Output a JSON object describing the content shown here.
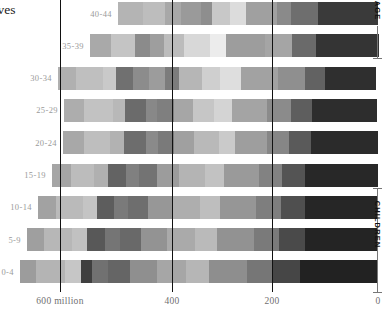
{
  "intro_text": {
    "lines": [
      "emselves",
      "n may",
      "mid."
    ]
  },
  "axis": {
    "ticks": [
      {
        "label": "600 million",
        "value": 600,
        "x": 60
      },
      {
        "label": "400",
        "value": 400,
        "x": 172
      },
      {
        "label": "200",
        "value": 200,
        "x": 272
      },
      {
        "label": "0",
        "value": 0,
        "x": 378
      }
    ]
  },
  "side_annotations": [
    {
      "label": "AGE",
      "name": "age-bracket"
    },
    {
      "label": "CHILDREN",
      "name": "children-bracket"
    }
  ],
  "chart_data": {
    "type": "bar",
    "title": "",
    "subtitle": "",
    "xlabel": "",
    "ylabel": "",
    "orientation": "horizontal",
    "stacked": true,
    "grid": true,
    "legend": false,
    "xlim": [
      0,
      660
    ],
    "x_direction": "right-to-left",
    "axis_ticks": [
      600,
      400,
      200,
      0
    ],
    "axis_tick_labels": [
      "600 million",
      "400",
      "200",
      "0"
    ],
    "categories": [
      "40-44",
      "35-39",
      "30-34",
      "25-29",
      "20-24",
      "15-19",
      "10-14",
      "5-9",
      "0-4"
    ],
    "note": "Horizontal stacked bars; each bar total is world population in that 5-year age band, split into region segments shown in greyscale shades.",
    "rows": [
      {
        "category": "40-44",
        "total": 490,
        "start_x": 118,
        "segments": [
          {
            "value": 48,
            "color": "#b4b4b4"
          },
          {
            "value": 40,
            "color": "#bdbdbd"
          },
          {
            "value": 30,
            "color": "#a8a8a8"
          },
          {
            "value": 38,
            "color": "#9a9a9a"
          },
          {
            "value": 22,
            "color": "#8e8e8e"
          },
          {
            "value": 34,
            "color": "#c8c8c8"
          },
          {
            "value": 30,
            "color": "#dcdcdc"
          },
          {
            "value": 58,
            "color": "#a0a0a0"
          },
          {
            "value": 26,
            "color": "#8a8a8a"
          },
          {
            "value": 52,
            "color": "#6e6e6e"
          },
          {
            "value": 112,
            "color": "#3a3a3a"
          }
        ]
      },
      {
        "category": "35-39",
        "total": 545,
        "start_x": 90,
        "segments": [
          {
            "value": 40,
            "color": "#a9a9a9"
          },
          {
            "value": 44,
            "color": "#c4c4c4"
          },
          {
            "value": 30,
            "color": "#8b8b8b"
          },
          {
            "value": 26,
            "color": "#9e9e9e"
          },
          {
            "value": 38,
            "color": "#bcbcbc"
          },
          {
            "value": 48,
            "color": "#d8d8d8"
          },
          {
            "value": 30,
            "color": "#ececec"
          },
          {
            "value": 74,
            "color": "#9d9d9d"
          },
          {
            "value": 52,
            "color": "#a5a5a5"
          },
          {
            "value": 44,
            "color": "#6a6a6a"
          },
          {
            "value": 119,
            "color": "#343434"
          }
        ]
      },
      {
        "category": "30-34",
        "total": 600,
        "start_x": 58,
        "segments": [
          {
            "value": 34,
            "color": "#b0b0b0"
          },
          {
            "value": 50,
            "color": "#bfbfbf"
          },
          {
            "value": 26,
            "color": "#c9c9c9"
          },
          {
            "value": 32,
            "color": "#707070"
          },
          {
            "value": 30,
            "color": "#8c8c8c"
          },
          {
            "value": 30,
            "color": "#9c9c9c"
          },
          {
            "value": 26,
            "color": "#7c7c7c"
          },
          {
            "value": 44,
            "color": "#b6b6b6"
          },
          {
            "value": 34,
            "color": "#cfcfcf"
          },
          {
            "value": 40,
            "color": "#dedede"
          },
          {
            "value": 70,
            "color": "#a2a2a2"
          },
          {
            "value": 50,
            "color": "#8f8f8f"
          },
          {
            "value": 38,
            "color": "#626262"
          },
          {
            "value": 96,
            "color": "#2f2f2f"
          }
        ]
      },
      {
        "category": "25-29",
        "total": 590,
        "start_x": 64,
        "segments": [
          {
            "value": 38,
            "color": "#adadad"
          },
          {
            "value": 54,
            "color": "#c2c2c2"
          },
          {
            "value": 24,
            "color": "#b8b8b8"
          },
          {
            "value": 38,
            "color": "#6b6b6b"
          },
          {
            "value": 22,
            "color": "#888888"
          },
          {
            "value": 32,
            "color": "#7f7f7f"
          },
          {
            "value": 36,
            "color": "#a6a6a6"
          },
          {
            "value": 40,
            "color": "#c6c6c6"
          },
          {
            "value": 34,
            "color": "#d4d4d4"
          },
          {
            "value": 66,
            "color": "#a4a4a4"
          },
          {
            "value": 44,
            "color": "#8b8b8b"
          },
          {
            "value": 40,
            "color": "#5e5e5e"
          },
          {
            "value": 122,
            "color": "#2d2d2d"
          }
        ]
      },
      {
        "category": "20-24",
        "total": 595,
        "start_x": 63,
        "segments": [
          {
            "value": 40,
            "color": "#a8a8a8"
          },
          {
            "value": 48,
            "color": "#bebebe"
          },
          {
            "value": 28,
            "color": "#b2b2b2"
          },
          {
            "value": 40,
            "color": "#6d6d6d"
          },
          {
            "value": 24,
            "color": "#8a8a8a"
          },
          {
            "value": 30,
            "color": "#7a7a7a"
          },
          {
            "value": 38,
            "color": "#a0a0a0"
          },
          {
            "value": 46,
            "color": "#b9b9b9"
          },
          {
            "value": 30,
            "color": "#cacaca"
          },
          {
            "value": 62,
            "color": "#9e9e9e"
          },
          {
            "value": 40,
            "color": "#868686"
          },
          {
            "value": 42,
            "color": "#5a5a5a"
          },
          {
            "value": 127,
            "color": "#2b2b2b"
          }
        ]
      },
      {
        "category": "15-19",
        "total": 615,
        "start_x": 52,
        "segments": [
          {
            "value": 36,
            "color": "#a5a5a5"
          },
          {
            "value": 44,
            "color": "#bcbcbc"
          },
          {
            "value": 26,
            "color": "#b0b0b0"
          },
          {
            "value": 34,
            "color": "#636363"
          },
          {
            "value": 24,
            "color": "#808080"
          },
          {
            "value": 34,
            "color": "#737373"
          },
          {
            "value": 42,
            "color": "#9c9c9c"
          },
          {
            "value": 48,
            "color": "#b4b4b4"
          },
          {
            "value": 36,
            "color": "#c2c2c2"
          },
          {
            "value": 66,
            "color": "#9a9a9a"
          },
          {
            "value": 44,
            "color": "#828282"
          },
          {
            "value": 44,
            "color": "#545454"
          },
          {
            "value": 137,
            "color": "#282828"
          }
        ]
      },
      {
        "category": "10-14",
        "total": 640,
        "start_x": 38,
        "segments": [
          {
            "value": 34,
            "color": "#a2a2a2"
          },
          {
            "value": 50,
            "color": "#bababa"
          },
          {
            "value": 28,
            "color": "#c4c4c4"
          },
          {
            "value": 32,
            "color": "#5d5d5d"
          },
          {
            "value": 26,
            "color": "#7a7a7a"
          },
          {
            "value": 38,
            "color": "#6e6e6e"
          },
          {
            "value": 46,
            "color": "#979797"
          },
          {
            "value": 52,
            "color": "#aeaeae"
          },
          {
            "value": 38,
            "color": "#bebebe"
          },
          {
            "value": 68,
            "color": "#969696"
          },
          {
            "value": 46,
            "color": "#7e7e7e"
          },
          {
            "value": 46,
            "color": "#4f4f4f"
          },
          {
            "value": 136,
            "color": "#262626"
          }
        ]
      },
      {
        "category": "5-9",
        "total": 660,
        "start_x": 27,
        "segments": [
          {
            "value": 32,
            "color": "#9f9f9f"
          },
          {
            "value": 52,
            "color": "#b7b7b7"
          },
          {
            "value": 30,
            "color": "#c1c1c1"
          },
          {
            "value": 34,
            "color": "#585858"
          },
          {
            "value": 28,
            "color": "#757575"
          },
          {
            "value": 40,
            "color": "#696969"
          },
          {
            "value": 48,
            "color": "#939393"
          },
          {
            "value": 54,
            "color": "#aaaaaa"
          },
          {
            "value": 40,
            "color": "#bababa"
          },
          {
            "value": 70,
            "color": "#929292"
          },
          {
            "value": 48,
            "color": "#7a7a7a"
          },
          {
            "value": 48,
            "color": "#4a4a4a"
          },
          {
            "value": 136,
            "color": "#242424"
          }
        ]
      },
      {
        "category": "0-4",
        "total": 675,
        "start_x": 20,
        "segments": [
          {
            "value": 30,
            "color": "#9c9c9c"
          },
          {
            "value": 54,
            "color": "#b4b4b4"
          },
          {
            "value": 32,
            "color": "#c6c6c6"
          },
          {
            "value": 20,
            "color": "#3f3f3f"
          },
          {
            "value": 30,
            "color": "#717171"
          },
          {
            "value": 42,
            "color": "#656565"
          },
          {
            "value": 50,
            "color": "#8f8f8f"
          },
          {
            "value": 56,
            "color": "#a6a6a6"
          },
          {
            "value": 42,
            "color": "#b6b6b6"
          },
          {
            "value": 72,
            "color": "#8e8e8e"
          },
          {
            "value": 50,
            "color": "#767676"
          },
          {
            "value": 50,
            "color": "#464646"
          },
          {
            "value": 147,
            "color": "#222222"
          }
        ]
      }
    ]
  }
}
